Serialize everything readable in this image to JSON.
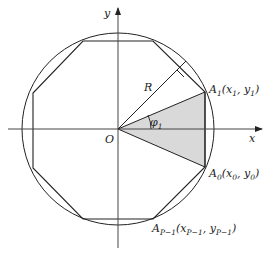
{
  "diagram": {
    "axes": {
      "x_label": "x",
      "y_label": "y",
      "origin_label": "O"
    },
    "radius_label": "R",
    "angle_label": {
      "symbol": "φ",
      "sub": "1"
    },
    "points": [
      {
        "id": "A1",
        "name": "A",
        "sub": "1",
        "coords": "(x",
        "x_sub": "1",
        "mid": ", y",
        "y_sub": "1",
        "end": ")"
      },
      {
        "id": "A0",
        "name": "A",
        "sub": "0",
        "coords": "(x",
        "x_sub": "0",
        "mid": ", y",
        "y_sub": "0",
        "end": ")"
      },
      {
        "id": "AP-1",
        "name": "A",
        "sub": "P−1",
        "coords": "(x",
        "x_sub": "P−1",
        "mid": ", y",
        "y_sub": "P−1",
        "end": ")"
      }
    ],
    "colors": {
      "stroke": "#222222",
      "shade": "#d9d9d9"
    }
  }
}
